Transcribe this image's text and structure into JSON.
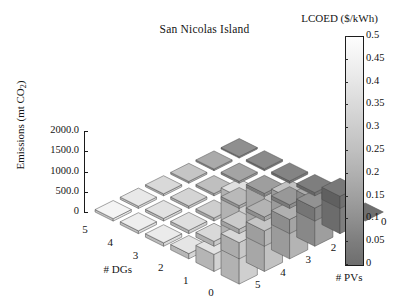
{
  "chart_data": {
    "type": "bar",
    "subtype": "bar3d",
    "title": "San Nicolas Island",
    "xlabel": "# DGs",
    "ylabel": "# PVs",
    "zlabel": "Emissions (mt CO2)",
    "zlabel_html": "Emissions (mt CO<sub>2</sub>)",
    "x_categories": [
      "5",
      "4",
      "3",
      "2",
      "1",
      "0"
    ],
    "y_categories": [
      "5",
      "4",
      "3",
      "2",
      "1",
      "0"
    ],
    "zlim": [
      0,
      2250
    ],
    "z_ticks": [
      "0",
      "500.0",
      "1000.0",
      "1500.0",
      "2000.0"
    ],
    "z_tick_values": [
      0,
      500,
      1000,
      1500,
      2000
    ],
    "grid": false,
    "colormap": "grayscale",
    "colorbar": {
      "title": "LCOED ($/kWh)",
      "min": 0,
      "max": 0.5,
      "ticks": [
        "0.5",
        "0.45",
        "0.4",
        "0.35",
        "0.3",
        "0.25",
        "0.2",
        "0.15",
        "0.1",
        "0.05",
        "0"
      ],
      "tick_values": [
        0.5,
        0.45,
        0.4,
        0.35,
        0.3,
        0.25,
        0.2,
        0.15,
        0.1,
        0.05,
        0
      ],
      "orientation": "vertical",
      "position": "right"
    },
    "note": "Heights are emissions (mt CO2); face shading encodes LCOED ($/kWh). Rows indexed by # DGs (5..0), columns by # PVs (5..0).",
    "rows": [
      {
        "dgs": "5",
        "bars": [
          {
            "pvs": "5",
            "emissions": 60,
            "lcoed": 0.47
          },
          {
            "pvs": "4",
            "emissions": 55,
            "lcoed": 0.43
          },
          {
            "pvs": "3",
            "emissions": 50,
            "lcoed": 0.38
          },
          {
            "pvs": "2",
            "emissions": 45,
            "lcoed": 0.31
          },
          {
            "pvs": "1",
            "emissions": 40,
            "lcoed": 0.22
          },
          {
            "pvs": "0",
            "emissions": 35,
            "lcoed": 0.13
          }
        ]
      },
      {
        "dgs": "4",
        "bars": [
          {
            "pvs": "5",
            "emissions": 70,
            "lcoed": 0.45
          },
          {
            "pvs": "4",
            "emissions": 65,
            "lcoed": 0.41
          },
          {
            "pvs": "3",
            "emissions": 60,
            "lcoed": 0.36
          },
          {
            "pvs": "2",
            "emissions": 55,
            "lcoed": 0.29
          },
          {
            "pvs": "1",
            "emissions": 50,
            "lcoed": 0.2
          },
          {
            "pvs": "0",
            "emissions": 45,
            "lcoed": 0.11
          }
        ]
      },
      {
        "dgs": "3",
        "bars": [
          {
            "pvs": "5",
            "emissions": 85,
            "lcoed": 0.44
          },
          {
            "pvs": "4",
            "emissions": 80,
            "lcoed": 0.4
          },
          {
            "pvs": "3",
            "emissions": 75,
            "lcoed": 0.34
          },
          {
            "pvs": "2",
            "emissions": 70,
            "lcoed": 0.27
          },
          {
            "pvs": "1",
            "emissions": 60,
            "lcoed": 0.18
          },
          {
            "pvs": "0",
            "emissions": 55,
            "lcoed": 0.09
          }
        ]
      },
      {
        "dgs": "2",
        "bars": [
          {
            "pvs": "5",
            "emissions": 130,
            "lcoed": 0.42
          },
          {
            "pvs": "4",
            "emissions": 120,
            "lcoed": 0.38
          },
          {
            "pvs": "3",
            "emissions": 110,
            "lcoed": 0.33
          },
          {
            "pvs": "2",
            "emissions": 100,
            "lcoed": 0.25
          },
          {
            "pvs": "1",
            "emissions": 90,
            "lcoed": 0.16
          },
          {
            "pvs": "0",
            "emissions": 80,
            "lcoed": 0.07
          }
        ]
      },
      {
        "dgs": "1",
        "bars": [
          {
            "pvs": "5",
            "emissions": 420,
            "lcoed": 0.41
          },
          {
            "pvs": "4",
            "emissions": 400,
            "lcoed": 0.37
          },
          {
            "pvs": "3",
            "emissions": 380,
            "lcoed": 0.31
          },
          {
            "pvs": "2",
            "emissions": 350,
            "lcoed": 0.24
          },
          {
            "pvs": "1",
            "emissions": 320,
            "lcoed": 0.14
          },
          {
            "pvs": "0",
            "emissions": 300,
            "lcoed": 0.05
          }
        ]
      },
      {
        "dgs": "0",
        "bars": [
          {
            "pvs": "5",
            "emissions": 2150,
            "lcoed": 0.4
          },
          {
            "pvs": "4",
            "emissions": 1850,
            "lcoed": 0.35
          },
          {
            "pvs": "3",
            "emissions": 1500,
            "lcoed": 0.3
          },
          {
            "pvs": "2",
            "emissions": 1150,
            "lcoed": 0.22
          },
          {
            "pvs": "1",
            "emissions": 800,
            "lcoed": 0.1
          },
          {
            "pvs": "0",
            "emissions": 0,
            "lcoed": 0.02
          }
        ]
      }
    ]
  },
  "figure": {
    "background": "#ffffff",
    "axis_color": "#1a1a1a"
  }
}
